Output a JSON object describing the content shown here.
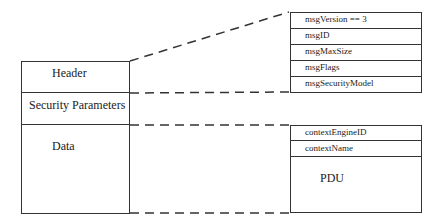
{
  "left_stack": {
    "sections": [
      {
        "label": "Header"
      },
      {
        "label": "Security Parameters"
      },
      {
        "label": "Data"
      }
    ]
  },
  "header_fields": [
    {
      "label": "msgVersion == 3"
    },
    {
      "label": "msgID"
    },
    {
      "label": "msgMaxSize"
    },
    {
      "label": "msgFlags"
    },
    {
      "label": "msgSecurityModel"
    }
  ],
  "data_fields": [
    {
      "label": "contextEngineID"
    },
    {
      "label": "contextName"
    },
    {
      "label": "PDU"
    }
  ]
}
